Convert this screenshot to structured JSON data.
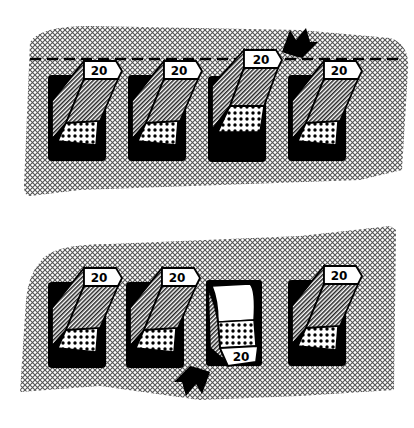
{
  "figure": {
    "colors": {
      "ink": "#000000",
      "paper": "#ffffff",
      "hatch": "#8a8a8a"
    }
  },
  "top_panel": {
    "reference_line": "dashed",
    "breakers": [
      {
        "label": "20",
        "state": "on"
      },
      {
        "label": "20",
        "state": "on"
      },
      {
        "label": "20",
        "state": "tripped"
      },
      {
        "label": "20",
        "state": "on"
      }
    ],
    "arrow": {
      "points_to": "breaker-3",
      "direction": "down-left"
    }
  },
  "bottom_panel": {
    "breakers": [
      {
        "label": "20",
        "state": "on"
      },
      {
        "label": "20",
        "state": "on"
      },
      {
        "label": "20",
        "state": "off"
      },
      {
        "label": "20",
        "state": "on"
      }
    ],
    "arrow": {
      "points_to": "breaker-3",
      "direction": "up-right"
    }
  }
}
